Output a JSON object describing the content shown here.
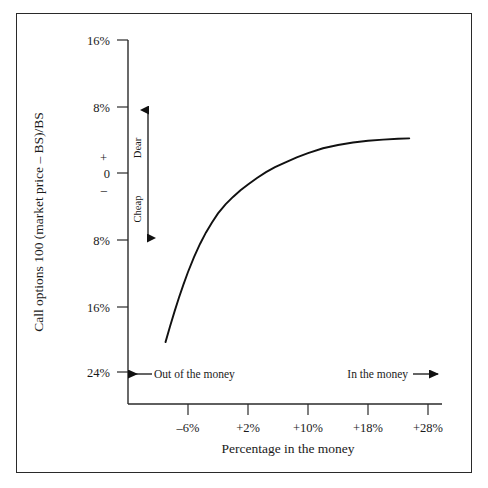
{
  "chart_data": {
    "type": "line",
    "title": "",
    "xlabel": "Percentage in the money",
    "ylabel": "Call options 100 (market price – BS)/BS",
    "xtick_labels": [
      "–6%",
      "+2%",
      "+10%",
      "+18%",
      "+28%"
    ],
    "xtick_values": [
      -6,
      2,
      10,
      18,
      28
    ],
    "ytick_labels": [
      "16%",
      "8%",
      "0",
      "8%",
      "16%",
      "24%"
    ],
    "ytick_values": [
      16,
      8,
      0,
      -8,
      -16,
      -24
    ],
    "ylim": [
      -28,
      20
    ],
    "xlim": [
      -14,
      32
    ],
    "grid": false,
    "legend": false,
    "zero_plus_sign": "+",
    "zero_minus_sign": "–",
    "series": [
      {
        "name": "Call option mispricing",
        "x": [
          -9.0,
          -8.4,
          -7.8,
          -7.2,
          -6.6,
          -6.0,
          -5.2,
          -4.4,
          -3.6,
          -2.8,
          -2.0,
          -1.0,
          0.0,
          1.0,
          2.0,
          3.2,
          4.4,
          5.6,
          7.0,
          8.5,
          10.0,
          12.0,
          14.0,
          16.0,
          18.0,
          20.0,
          22.0,
          23.5
        ],
        "y": [
          -20.5,
          -18.6,
          -16.8,
          -15.1,
          -13.5,
          -12.0,
          -10.2,
          -8.6,
          -7.2,
          -6.0,
          -4.9,
          -3.8,
          -2.9,
          -2.1,
          -1.4,
          -0.6,
          0.1,
          0.7,
          1.3,
          1.9,
          2.4,
          3.0,
          3.4,
          3.7,
          3.9,
          4.05,
          4.15,
          4.2
        ]
      }
    ],
    "annotations": {
      "dear": "Dear",
      "cheap": "Cheap",
      "out_of_money": "Out of the money",
      "in_money": "In the money"
    }
  },
  "colors": {
    "frame": "#2a2a2a",
    "axis": "#2a2a2a",
    "curve": "#111111",
    "text": "#1a1a1a",
    "background": "#ffffff"
  }
}
